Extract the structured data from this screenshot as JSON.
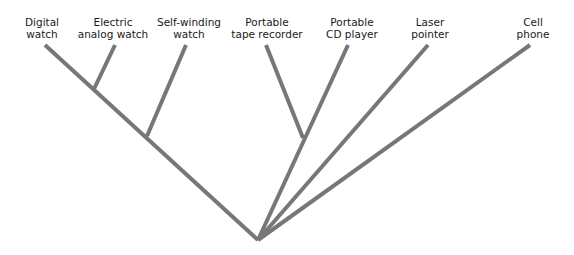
{
  "diagram": {
    "type": "cladogram",
    "line_color": "#777777",
    "taxa": [
      {
        "id": "digital-watch",
        "line1": "Digital",
        "line2": "watch"
      },
      {
        "id": "electric-analog-watch",
        "line1": "Electric",
        "line2": "analog watch"
      },
      {
        "id": "self-winding-watch",
        "line1": "Self-winding",
        "line2": "watch"
      },
      {
        "id": "portable-tape-recorder",
        "line1": "Portable",
        "line2": "tape recorder"
      },
      {
        "id": "portable-cd-player",
        "line1": "Portable",
        "line2": "CD player"
      },
      {
        "id": "laser-pointer",
        "line1": "Laser",
        "line2": "pointer"
      },
      {
        "id": "cell-phone",
        "line1": "Cell",
        "line2": "phone"
      }
    ]
  }
}
